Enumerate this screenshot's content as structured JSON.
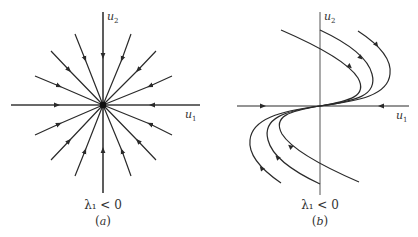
{
  "panels": [
    {
      "id": "a",
      "type": "star-node",
      "axis_x_label": "u",
      "axis_x_sub": "1",
      "axis_y_label": "u",
      "axis_y_sub": "2",
      "condition": "λ₁ < 0",
      "caption_open": "(",
      "caption_letter": "a",
      "caption_close": ")",
      "description": "Stable star node: all trajectories are straight rays converging to the origin"
    },
    {
      "id": "b",
      "type": "degenerate-node",
      "axis_x_label": "u",
      "axis_x_sub": "1",
      "axis_y_label": "u",
      "axis_y_sub": "2",
      "condition": "λ₁ < 0",
      "caption_open": "(",
      "caption_letter": "b",
      "caption_close": ")",
      "description": "Stable degenerate (improper) node: curved trajectories approach origin tangent to u1-axis"
    }
  ],
  "colors": {
    "line": "#2a2a2a",
    "axis": "#555555",
    "background": "#ffffff"
  }
}
